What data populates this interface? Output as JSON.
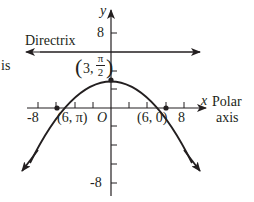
{
  "diagram": {
    "type": "polar-parabola",
    "axes": {
      "x_label": "x",
      "y_label": "y",
      "polar_axis_label_line1": "Polar",
      "polar_axis_label_line2": "axis",
      "origin_label": "O",
      "x_tick_labels": [
        "-8",
        "8"
      ],
      "y_tick_labels": [
        "8",
        "-8"
      ]
    },
    "directrix": {
      "label": "Directrix",
      "y_value": 6
    },
    "partial_left_text": "is",
    "points": [
      {
        "label_r": "3",
        "label_theta_num": "π",
        "label_theta_den": "2",
        "full": "(3, π/2)",
        "x": 0,
        "y": 3
      },
      {
        "label": "(6, π)",
        "x": -6,
        "y": 0
      },
      {
        "label": "(6, 0)",
        "x": 6,
        "y": 0
      }
    ],
    "curve": "y = 3 - x^2/12",
    "colors": {
      "ink": "#231f20",
      "background": "#ffffff"
    }
  }
}
